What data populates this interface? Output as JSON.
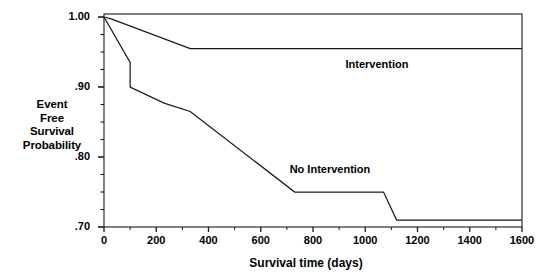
{
  "chart_data": {
    "type": "line",
    "title": "",
    "xlabel": "Survival time (days)",
    "ylabel": "Event Free Survival Probability",
    "ylabel_lines": [
      "Event",
      "Free",
      "Survival",
      "Probability"
    ],
    "xlim": [
      0,
      1600
    ],
    "ylim": [
      0.7,
      1.0
    ],
    "xticks": [
      0,
      200,
      400,
      600,
      800,
      1000,
      1200,
      1400,
      1600
    ],
    "xtick_labels": [
      "0",
      "200",
      "400",
      "600",
      "800",
      "1000",
      "1200",
      "1400",
      "1600"
    ],
    "yticks": [
      0.7,
      0.8,
      0.9,
      1.0
    ],
    "ytick_labels": [
      ".70",
      ".80",
      ".90",
      "1.00"
    ],
    "y_minor_ticks": [
      0.725,
      0.75,
      0.775,
      0.825,
      0.85,
      0.875,
      0.925,
      0.95,
      0.975
    ],
    "grid": false,
    "legend": "inline-annotations",
    "line_color": "#1a1a1a",
    "axis_color": "#1a1a1a",
    "background": "#ffffff",
    "series": [
      {
        "name": "Intervention",
        "label_x": 1060,
        "label_y": 0.932,
        "x": [
          0,
          30,
          330,
          1600
        ],
        "y": [
          1.0,
          0.997,
          0.955,
          0.955
        ]
      },
      {
        "name": "No Intervention",
        "label_x": 880,
        "label_y": 0.782,
        "x": [
          0,
          100,
          100,
          230,
          330,
          730,
          1070,
          1120,
          1600
        ],
        "y": [
          1.0,
          0.935,
          0.9,
          0.877,
          0.865,
          0.75,
          0.75,
          0.71,
          0.71
        ]
      }
    ]
  },
  "annotations": {
    "intervention_label": "Intervention",
    "no_intervention_label": "No Intervention"
  }
}
